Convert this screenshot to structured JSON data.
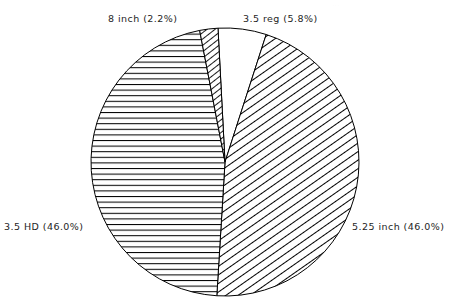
{
  "chart_data": {
    "type": "pie",
    "title": "",
    "subtitle": "",
    "xlabel": "",
    "ylabel": "",
    "legend_position": "outside-labels",
    "grid": false,
    "start_angle_deg": -3,
    "direction": "clockwise",
    "center": {
      "x": 225,
      "y": 162
    },
    "radius": 134,
    "categories": [
      "3.5 reg",
      "5.25 inch",
      "3.5 HD",
      "8 inch"
    ],
    "values": [
      5.8,
      46.0,
      46.0,
      2.2
    ],
    "units": "percent",
    "slices": [
      {
        "name": "3.5 reg",
        "value": 5.8,
        "label": "3.5 reg (5.8%)",
        "fill": "none",
        "pattern": "blank",
        "stroke": "#000000",
        "start_deg": -3.0,
        "end_deg": 17.9
      },
      {
        "name": "5.25 inch",
        "value": 46.0,
        "label": "5.25 inch (46.0%)",
        "fill": "pattern",
        "pattern": "diagonal-down-right",
        "stroke": "#000000",
        "start_deg": 17.9,
        "end_deg": 183.5
      },
      {
        "name": "3.5 HD",
        "value": 46.0,
        "label": "3.5 HD (46.0%)",
        "fill": "pattern",
        "pattern": "horizontal",
        "stroke": "#000000",
        "start_deg": 183.5,
        "end_deg": 349.1
      },
      {
        "name": "8 inch",
        "value": 2.2,
        "label": "8 inch (2.2%)",
        "fill": "pattern",
        "pattern": "diagonal-down-right-dense",
        "stroke": "#000000",
        "start_deg": 349.1,
        "end_deg": 357.0
      }
    ]
  },
  "labels": {
    "eight_inch": "8 inch (2.2%)",
    "three_five_reg": "3.5 reg (5.8%)",
    "three_five_hd": "3.5 HD (46.0%)",
    "five_twentyfive_inch": "5.25 inch (46.0%)"
  },
  "artifact": {
    "top_fragment": "..."
  },
  "colors": {
    "stroke": "#000000",
    "background": "#ffffff",
    "text": "#1e1e1e"
  }
}
